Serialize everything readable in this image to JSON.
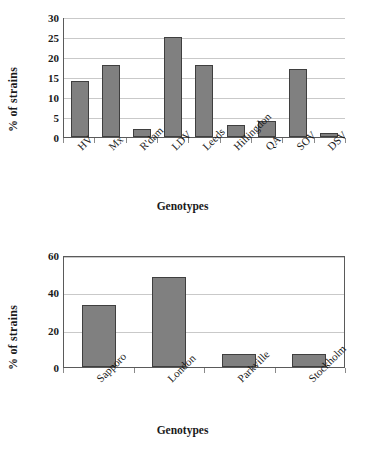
{
  "chart_data": [
    {
      "type": "bar",
      "title": "",
      "xlabel": "Genotypes",
      "ylabel": "% of strains",
      "categories": [
        "HV",
        "Mx",
        "R'dam",
        "LDV",
        "Leeds",
        "Hillingdon",
        "QA",
        "SOV",
        "DSV"
      ],
      "values": [
        14,
        18,
        2,
        25,
        18,
        3,
        4,
        17,
        1
      ],
      "yticks": [
        0,
        5,
        10,
        15,
        20,
        25,
        30
      ],
      "ylim": [
        0,
        30
      ],
      "grid": true,
      "legend": "none",
      "bar_color": "#808080",
      "bar_edge_color": "#3f3f3f"
    },
    {
      "type": "bar",
      "title": "",
      "xlabel": "Genotypes",
      "ylabel": "% of strains",
      "categories": [
        "Sapporo",
        "London",
        "Parkville",
        "Stockholm"
      ],
      "values": [
        33,
        48,
        7,
        7
      ],
      "yticks": [
        0,
        20,
        40,
        60
      ],
      "ylim": [
        0,
        60
      ],
      "grid": true,
      "legend": "none",
      "bar_color": "#808080",
      "bar_edge_color": "#3f3f3f"
    }
  ]
}
